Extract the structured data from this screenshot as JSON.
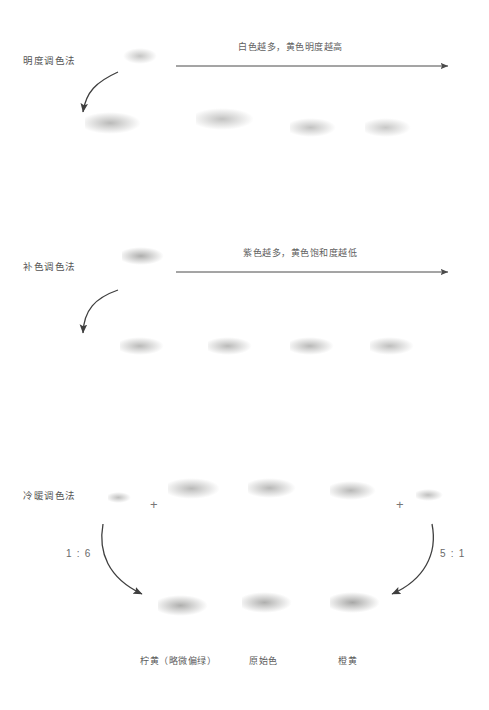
{
  "page": {
    "width": 489,
    "height": 710,
    "background": "#ffffff"
  },
  "sections": [
    {
      "id": "brightness",
      "method_label": "明度调色法",
      "arrow_caption": "白色越多，黄色明度越高"
    },
    {
      "id": "complementary",
      "method_label": "补色调色法",
      "arrow_caption": "紫色越多，黄色饱和度越低"
    },
    {
      "id": "warm-cool",
      "method_label": "冷暖调色法",
      "ratio_left": "1 : 6",
      "ratio_right": "5 : 1",
      "plus_left": "+",
      "plus_right": "+",
      "results": [
        "柠黄（略微偏绿）",
        "原始色",
        "橙黄"
      ]
    }
  ],
  "colors": {
    "text": "#5a5a5a",
    "arrow": "#4a4a4a",
    "shadow": "#9a9a9a",
    "source_ball_s1": "#f4f3ee",
    "source_ball_s2": "#b9bab0",
    "pale_ball": "#f7f7f3",
    "background": "#ffffff"
  },
  "balls": {
    "section1_source": {
      "x": 123,
      "y": 48,
      "d": 38,
      "color": "#f3f2ec"
    },
    "section1_row": [
      {
        "x": 85,
        "y": 112,
        "d": 58,
        "color": "#f6f6f2"
      },
      {
        "x": 196,
        "y": 108,
        "d": 60,
        "color": "#f7f7f4"
      },
      {
        "x": 290,
        "y": 118,
        "d": 48,
        "color": "#f6f6f3"
      },
      {
        "x": 365,
        "y": 118,
        "d": 48,
        "color": "#f7f7f4"
      }
    ],
    "section2_source": {
      "x": 122,
      "y": 247,
      "d": 44,
      "color": "#b7b8ae"
    },
    "section2_row": [
      {
        "x": 120,
        "y": 337,
        "d": 46,
        "color": "#f2f2ee"
      },
      {
        "x": 208,
        "y": 337,
        "d": 46,
        "color": "#f3f3ef"
      },
      {
        "x": 290,
        "y": 337,
        "d": 46,
        "color": "#f3f3f0"
      },
      {
        "x": 370,
        "y": 337,
        "d": 46,
        "color": "#f4f4f1"
      }
    ],
    "section3_top": [
      {
        "x": 108,
        "y": 492,
        "d": 24,
        "color": "#f0f0ec"
      },
      {
        "x": 168,
        "y": 478,
        "d": 54,
        "color": "#f6f6f3"
      },
      {
        "x": 248,
        "y": 478,
        "d": 50,
        "color": "#f6f6f3"
      },
      {
        "x": 330,
        "y": 481,
        "d": 48,
        "color": "#f6f6f3"
      },
      {
        "x": 416,
        "y": 489,
        "d": 28,
        "color": "#f0f0ec"
      }
    ],
    "section3_bottom": [
      {
        "x": 158,
        "y": 595,
        "d": 52,
        "color": "#f5f5f2"
      },
      {
        "x": 242,
        "y": 592,
        "d": 52,
        "color": "#f6f6f3"
      },
      {
        "x": 330,
        "y": 592,
        "d": 52,
        "color": "#f5f5f2"
      }
    ]
  }
}
